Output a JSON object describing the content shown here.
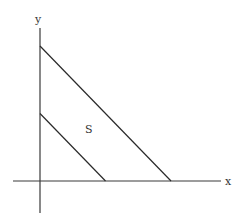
{
  "diagram": {
    "axes": {
      "x_label": "x",
      "y_label": "y"
    },
    "region_label": "S",
    "lines": [
      {
        "name": "inner-boundary",
        "x_intercept": 1,
        "y_intercept": 1
      },
      {
        "name": "outer-boundary",
        "x_intercept": 2,
        "y_intercept": 2
      }
    ],
    "colors": {
      "stroke": "#2a2a2a",
      "background": "#ffffff"
    }
  }
}
